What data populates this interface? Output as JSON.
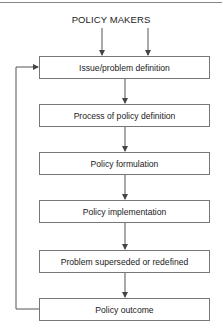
{
  "diagram": {
    "title": "POLICY MAKERS",
    "steps": [
      {
        "label": "Issue/problem definition"
      },
      {
        "label": "Process of policy definition"
      },
      {
        "label": "Policy formulation"
      },
      {
        "label": "Policy implementation"
      },
      {
        "label": "Problem superseded or redefined"
      },
      {
        "label": "Policy outcome"
      }
    ],
    "edges": [
      {
        "from": "POLICY MAKERS",
        "to": "Issue/problem definition",
        "count": 2
      },
      {
        "from": "Issue/problem definition",
        "to": "Process of policy definition"
      },
      {
        "from": "Process of policy definition",
        "to": "Policy formulation"
      },
      {
        "from": "Policy formulation",
        "to": "Policy implementation"
      },
      {
        "from": "Policy implementation",
        "to": "Problem superseded or redefined"
      },
      {
        "from": "Problem superseded or redefined",
        "to": "Policy outcome"
      },
      {
        "from": "Policy outcome",
        "to": "Issue/problem definition",
        "type": "feedback-loop"
      }
    ],
    "line_color": "#555555",
    "box_border_color": "#777777"
  }
}
